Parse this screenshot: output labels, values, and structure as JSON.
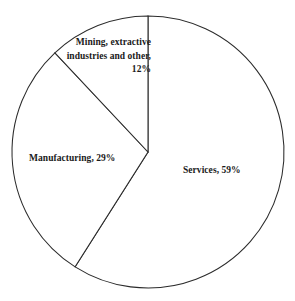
{
  "chart_data": {
    "type": "pie",
    "title": "",
    "categories": [
      "Services",
      "Manufacturing",
      "Mining, extractive industries and other"
    ],
    "values": [
      59,
      29,
      12
    ],
    "value_unit": "%",
    "labels": [
      "Services, 59%",
      "Manufacturing, 29%",
      "Mining, extractive industries and other, 12%"
    ],
    "start_angle_deg": 0,
    "direction": "clockwise",
    "legend": "none",
    "grid": false,
    "slice_fill": "#ffffff",
    "slice_stroke": "#2b2b2b",
    "text_color": "#1a1a1a"
  },
  "figure": {
    "background": "#ffffff",
    "center_x": 148,
    "center_y": 152,
    "radius": 136
  },
  "labels": {
    "services": {
      "text": "Services, 59%"
    },
    "manufacturing": {
      "text": "Manufacturing, 29%"
    },
    "mining": {
      "line1": "Mining, extractive",
      "line2": "industries and other,",
      "line3": "12%"
    }
  }
}
